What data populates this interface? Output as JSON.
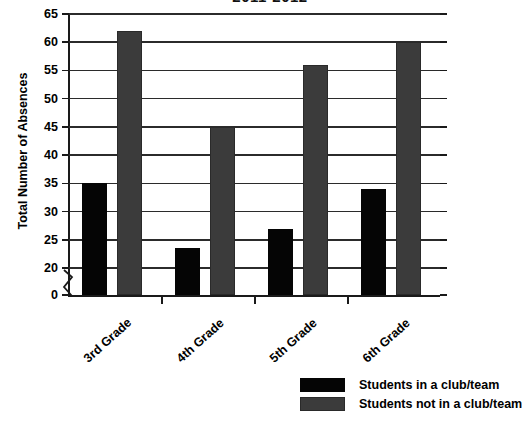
{
  "chart_data": {
    "type": "bar",
    "title": "2011-2012",
    "title_note": "title is clipped by the top edge of the screenshot",
    "xlabel": "",
    "ylabel": "Total Number of Absences",
    "categories": [
      "3rd Grade",
      "4th Grade",
      "5th Grade",
      "6th Grade"
    ],
    "series": [
      {
        "name": "Students in a club/team",
        "color": "#050505",
        "values": [
          35,
          23.5,
          27,
          34
        ]
      },
      {
        "name": "Students not in a club/team",
        "color": "#3b3b3b",
        "values": [
          62,
          45,
          56,
          60
        ]
      }
    ],
    "ylim": [
      0,
      65
    ],
    "yticks": [
      0,
      20,
      25,
      30,
      35,
      40,
      45,
      50,
      55,
      60,
      65
    ],
    "ytick_labels": [
      "0",
      "20",
      "25",
      "30",
      "35",
      "40",
      "45",
      "50",
      "55",
      "60",
      "65"
    ],
    "y_axis_break": true,
    "y_axis_break_between": [
      0,
      20
    ],
    "grid": true,
    "grid_axis": "y",
    "legend_position": "bottom-right"
  },
  "legend": {
    "entries": [
      {
        "label": "Students in a club/team"
      },
      {
        "label": "Students not in a club/team"
      }
    ]
  }
}
